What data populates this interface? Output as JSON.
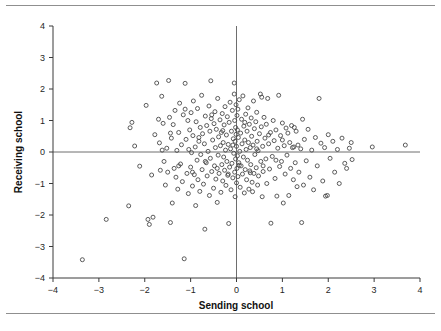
{
  "figure": {
    "background": "#ffffff",
    "rule_color": "#8f8f8f",
    "top_rule": true,
    "bottom_rule": true
  },
  "chart_data": {
    "type": "scatter",
    "title": "",
    "xlabel": "Sending school",
    "ylabel": "Receiving school",
    "xlim": [
      -4,
      4
    ],
    "ylim": [
      -4,
      4
    ],
    "xticks": [
      -4,
      -3,
      -2,
      -1,
      0,
      1,
      2,
      3,
      4
    ],
    "yticks": [
      -4,
      -3,
      -2,
      -1,
      0,
      1,
      2,
      3,
      4
    ],
    "xticklabels": [
      "-4",
      "-3",
      "-2",
      "-1",
      "0",
      "1",
      "2",
      "3",
      "4"
    ],
    "yticklabels": [
      "-4",
      "-3",
      "-2",
      "-1",
      "0",
      "1",
      "2",
      "3",
      "4"
    ],
    "grid": false,
    "legend": null,
    "reference_lines": [
      {
        "orientation": "horizontal",
        "value": 0,
        "color": "#6e6e6e"
      },
      {
        "orientation": "vertical",
        "value": 0,
        "color": "#6e6e6e"
      }
    ],
    "marker": {
      "shape": "circle-open",
      "size": 4,
      "color": "#4a4a4a"
    },
    "n_points": 284,
    "points": [
      [
        -3.36,
        -3.42
      ],
      [
        -2.84,
        -2.14
      ],
      [
        -2.32,
        0.77
      ],
      [
        -2.28,
        0.94
      ],
      [
        -2.35,
        -1.71
      ],
      [
        -2.22,
        0.19
      ],
      [
        -2.11,
        -0.45
      ],
      [
        -1.97,
        1.48
      ],
      [
        -1.93,
        -2.14
      ],
      [
        -1.9,
        -2.3
      ],
      [
        -1.85,
        -0.73
      ],
      [
        -1.82,
        -2.07
      ],
      [
        -1.78,
        0.55
      ],
      [
        -1.74,
        2.19
      ],
      [
        -1.7,
        1.04
      ],
      [
        -1.68,
        0.29
      ],
      [
        -1.66,
        -0.58
      ],
      [
        -1.63,
        1.77
      ],
      [
        -1.6,
        0.91
      ],
      [
        -1.58,
        -0.3
      ],
      [
        -1.55,
        -1.05
      ],
      [
        -1.52,
        0.12
      ],
      [
        -1.5,
        -0.64
      ],
      [
        -1.48,
        2.27
      ],
      [
        -1.46,
        1.1
      ],
      [
        -1.44,
        -2.24
      ],
      [
        -1.42,
        0.44
      ],
      [
        -1.4,
        -1.62
      ],
      [
        -1.38,
        0.87
      ],
      [
        -1.36,
        -0.52
      ],
      [
        -1.34,
        1.32
      ],
      [
        -1.32,
        -0.8
      ],
      [
        -1.3,
        0.05
      ],
      [
        -1.28,
        -1.18
      ],
      [
        -1.26,
        0.62
      ],
      [
        -1.24,
        1.55
      ],
      [
        -1.22,
        -0.38
      ],
      [
        -1.2,
        0.23
      ],
      [
        -1.18,
        -0.94
      ],
      [
        -1.16,
        1.18
      ],
      [
        -1.14,
        -3.39
      ],
      [
        -1.12,
        2.18
      ],
      [
        -1.1,
        0.4
      ],
      [
        -1.08,
        -0.68
      ],
      [
        -1.06,
        1.0
      ],
      [
        -1.05,
        -1.32
      ],
      [
        -1.04,
        0.08
      ],
      [
        -1.02,
        0.7
      ],
      [
        -1.0,
        -0.48
      ],
      [
        -0.99,
        1.25
      ],
      [
        -0.98,
        -0.02
      ],
      [
        -0.96,
        -1.08
      ],
      [
        -0.95,
        0.52
      ],
      [
        -0.94,
        1.62
      ],
      [
        -0.92,
        -0.72
      ],
      [
        -0.9,
        0.16
      ],
      [
        -0.89,
        -1.7
      ],
      [
        -0.88,
        0.96
      ],
      [
        -0.86,
        -0.26
      ],
      [
        -0.85,
        1.38
      ],
      [
        -0.84,
        -0.88
      ],
      [
        -0.82,
        0.34
      ],
      [
        -0.8,
        -1.25
      ],
      [
        -0.79,
        0.78
      ],
      [
        -0.78,
        -0.08
      ],
      [
        -0.76,
        1.8
      ],
      [
        -0.75,
        -0.56
      ],
      [
        -0.74,
        0.58
      ],
      [
        -0.72,
        -1.02
      ],
      [
        -0.7,
        0.26
      ],
      [
        -0.69,
        -2.45
      ],
      [
        -0.68,
        1.14
      ],
      [
        -0.66,
        -0.34
      ],
      [
        -0.65,
        0.84
      ],
      [
        -0.64,
        -0.76
      ],
      [
        -0.62,
        0.02
      ],
      [
        -0.6,
        1.46
      ],
      [
        -0.59,
        -1.38
      ],
      [
        -0.58,
        0.66
      ],
      [
        -0.57,
        -0.2
      ],
      [
        -0.56,
        2.26
      ],
      [
        -0.55,
        1.06
      ],
      [
        -0.54,
        -0.62
      ],
      [
        -0.52,
        0.38
      ],
      [
        -0.5,
        -1.15
      ],
      [
        -0.49,
        0.9
      ],
      [
        -0.48,
        -0.44
      ],
      [
        -0.47,
        1.28
      ],
      [
        -0.46,
        0.14
      ],
      [
        -0.45,
        -0.86
      ],
      [
        -0.44,
        0.72
      ],
      [
        -0.42,
        -1.6
      ],
      [
        -0.41,
        1.7
      ],
      [
        -0.4,
        -0.1
      ],
      [
        -0.39,
        0.48
      ],
      [
        -0.38,
        -0.68
      ],
      [
        -0.36,
        1.02
      ],
      [
        -0.35,
        0.2
      ],
      [
        -0.34,
        -1.28
      ],
      [
        -0.33,
        0.62
      ],
      [
        -0.32,
        -0.4
      ],
      [
        -0.31,
        1.22
      ],
      [
        -0.3,
        -0.92
      ],
      [
        -0.29,
        0.3
      ],
      [
        -0.28,
        -0.16
      ],
      [
        -0.27,
        0.86
      ],
      [
        -0.26,
        -0.58
      ],
      [
        -0.25,
        1.44
      ],
      [
        -0.24,
        0.06
      ],
      [
        -0.23,
        -1.06
      ],
      [
        -0.22,
        0.54
      ],
      [
        -0.21,
        -0.3
      ],
      [
        -0.2,
        1.12
      ],
      [
        -0.19,
        -0.74
      ],
      [
        -0.18,
        0.24
      ],
      [
        -0.17,
        -2.27
      ],
      [
        -0.16,
        0.94
      ],
      [
        -0.15,
        -0.48
      ],
      [
        -0.14,
        1.58
      ],
      [
        -0.13,
        0.1
      ],
      [
        -0.12,
        -1.2
      ],
      [
        -0.11,
        0.66
      ],
      [
        -0.1,
        -0.36
      ],
      [
        -0.09,
        1.32
      ],
      [
        -0.08,
        -0.82
      ],
      [
        -0.07,
        0.42
      ],
      [
        -0.06,
        -0.04
      ],
      [
        -0.05,
        2.19
      ],
      [
        -0.05,
        1.84
      ],
      [
        -0.04,
        1.0
      ],
      [
        -0.04,
        -0.64
      ],
      [
        -0.03,
        0.34
      ],
      [
        -0.03,
        -1.42
      ],
      [
        -0.02,
        0.78
      ],
      [
        -0.02,
        -0.22
      ],
      [
        -0.01,
        1.5
      ],
      [
        -0.01,
        0.56
      ],
      [
        0.0,
        -0.98
      ],
      [
        0.0,
        0.18
      ],
      [
        0.01,
        1.16
      ],
      [
        0.01,
        -0.52
      ],
      [
        0.02,
        0.7
      ],
      [
        0.02,
        -0.12
      ],
      [
        0.03,
        1.36
      ],
      [
        0.03,
        -0.78
      ],
      [
        0.04,
        0.46
      ],
      [
        0.05,
        -0.34
      ],
      [
        0.06,
        1.66
      ],
      [
        0.07,
        0.02
      ],
      [
        0.08,
        -1.12
      ],
      [
        0.09,
        0.6
      ],
      [
        0.1,
        -0.44
      ],
      [
        0.11,
        1.04
      ],
      [
        0.12,
        0.26
      ],
      [
        0.13,
        -0.7
      ],
      [
        0.14,
        1.78
      ],
      [
        0.15,
        -0.16
      ],
      [
        0.16,
        0.82
      ],
      [
        0.17,
        -1.3
      ],
      [
        0.18,
        0.38
      ],
      [
        0.19,
        -0.56
      ],
      [
        0.2,
        1.2
      ],
      [
        0.21,
        0.08
      ],
      [
        0.22,
        -0.88
      ],
      [
        0.23,
        0.66
      ],
      [
        0.24,
        -0.26
      ],
      [
        0.25,
        1.4
      ],
      [
        0.26,
        0.3
      ],
      [
        0.27,
        -1.18
      ],
      [
        0.28,
        0.88
      ],
      [
        0.29,
        -0.6
      ],
      [
        0.3,
        0.14
      ],
      [
        0.31,
        -0.4
      ],
      [
        0.32,
        1.08
      ],
      [
        0.33,
        0.5
      ],
      [
        0.34,
        -0.96
      ],
      [
        0.35,
        -1.26
      ],
      [
        0.36,
        0.22
      ],
      [
        0.37,
        1.62
      ],
      [
        0.38,
        -0.68
      ],
      [
        0.39,
        0.74
      ],
      [
        0.4,
        -0.08
      ],
      [
        0.42,
        0.96
      ],
      [
        0.43,
        -0.5
      ],
      [
        0.44,
        1.26
      ],
      [
        0.45,
        0.34
      ],
      [
        0.46,
        -1.05
      ],
      [
        0.47,
        0.04
      ],
      [
        0.48,
        -0.76
      ],
      [
        0.5,
        0.58
      ],
      [
        0.52,
        1.84
      ],
      [
        0.53,
        -0.3
      ],
      [
        0.54,
        0.8
      ],
      [
        0.55,
        1.74
      ],
      [
        0.56,
        -1.42
      ],
      [
        0.57,
        0.18
      ],
      [
        0.58,
        -0.62
      ],
      [
        0.6,
        1.1
      ],
      [
        0.62,
        0.44
      ],
      [
        0.64,
        -0.22
      ],
      [
        0.65,
        0.88
      ],
      [
        0.66,
        -1.0
      ],
      [
        0.68,
        1.7
      ],
      [
        0.7,
        0.26
      ],
      [
        0.72,
        -0.54
      ],
      [
        0.74,
        0.62
      ],
      [
        0.75,
        -2.26
      ],
      [
        0.78,
        -0.14
      ],
      [
        0.8,
        1.0
      ],
      [
        0.82,
        0.36
      ],
      [
        0.84,
        -0.84
      ],
      [
        0.86,
        0.7
      ],
      [
        0.88,
        -1.4
      ],
      [
        0.9,
        0.12
      ],
      [
        0.92,
        1.8
      ],
      [
        0.94,
        -0.46
      ],
      [
        0.96,
        0.52
      ],
      [
        0.98,
        -0.3
      ],
      [
        1.0,
        0.92
      ],
      [
        1.02,
        -1.62
      ],
      [
        1.04,
        0.2
      ],
      [
        1.06,
        -0.7
      ],
      [
        1.08,
        0.76
      ],
      [
        1.1,
        -0.1
      ],
      [
        1.12,
        0.6
      ],
      [
        1.14,
        -1.38
      ],
      [
        1.16,
        0.3
      ],
      [
        1.18,
        -0.52
      ],
      [
        1.2,
        0.84
      ],
      [
        1.22,
        0.14
      ],
      [
        1.24,
        -0.88
      ],
      [
        1.25,
        0.16
      ],
      [
        1.26,
        0.78
      ],
      [
        1.28,
        -0.34
      ],
      [
        1.3,
        0.66
      ],
      [
        1.32,
        -1.1
      ],
      [
        1.34,
        0.22
      ],
      [
        1.36,
        -0.64
      ],
      [
        1.4,
        0.1
      ],
      [
        1.42,
        -2.24
      ],
      [
        1.44,
        1.04
      ],
      [
        1.46,
        -1.05
      ],
      [
        1.48,
        0.4
      ],
      [
        1.52,
        -0.28
      ],
      [
        1.56,
        0.72
      ],
      [
        1.6,
        -0.8
      ],
      [
        1.64,
        0.06
      ],
      [
        1.68,
        -1.2
      ],
      [
        1.72,
        0.46
      ],
      [
        1.76,
        -0.44
      ],
      [
        1.8,
        1.7
      ],
      [
        1.84,
        0.28
      ],
      [
        1.88,
        -0.92
      ],
      [
        1.92,
        0.14
      ],
      [
        1.94,
        -1.4
      ],
      [
        1.98,
        -1.38
      ],
      [
        2.0,
        0.55
      ],
      [
        2.04,
        -0.2
      ],
      [
        2.1,
        0.34
      ],
      [
        2.14,
        -0.64
      ],
      [
        2.2,
        0.08
      ],
      [
        2.24,
        -1.0
      ],
      [
        2.3,
        0.44
      ],
      [
        2.36,
        -0.36
      ],
      [
        2.4,
        -0.52
      ],
      [
        2.46,
        0.12
      ],
      [
        2.5,
        0.3
      ],
      [
        2.52,
        -0.24
      ],
      [
        2.96,
        0.16
      ],
      [
        3.68,
        0.22
      ],
      [
        -1.62,
        0.06
      ],
      [
        -1.44,
        0.6
      ],
      [
        -1.26,
        -0.44
      ],
      [
        -1.12,
        1.36
      ],
      [
        -0.96,
        -0.64
      ],
      [
        -0.82,
        0.46
      ],
      [
        -0.68,
        -0.3
      ],
      [
        -0.54,
        1.18
      ],
      [
        -0.42,
        -0.52
      ],
      [
        -0.3,
        0.68
      ],
      [
        -0.18,
        -0.7
      ],
      [
        -0.08,
        0.22
      ],
      [
        0.06,
        -0.42
      ],
      [
        0.18,
        0.94
      ],
      [
        0.3,
        -0.66
      ],
      [
        0.44,
        0.1
      ],
      [
        0.58,
        -0.44
      ],
      [
        0.7,
        0.54
      ],
      [
        0.86,
        -0.26
      ],
      [
        1.0,
        0.38
      ]
    ]
  }
}
